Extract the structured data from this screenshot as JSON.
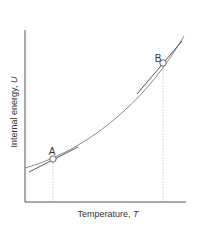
{
  "diagram": {
    "x_axis_label": "Temperature, ",
    "x_axis_symbol": "T",
    "y_axis_label": "Internal energy, ",
    "y_axis_symbol": "U",
    "points": [
      {
        "label": "A"
      },
      {
        "label": "B"
      }
    ],
    "colors": {
      "axis": "#555555",
      "curve": "#888888",
      "tangent": "#444444",
      "guide": "#bbbbbb"
    }
  }
}
